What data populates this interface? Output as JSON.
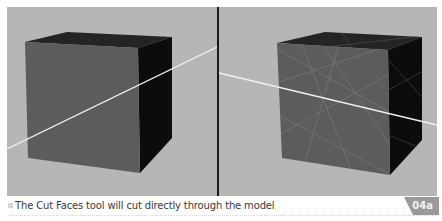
{
  "figure": {
    "caption": "The Cut Faces tool will cut directly through the model",
    "badge": "04a",
    "colors": {
      "viewport_bg": "#b6b6b6",
      "cube_front": "#5c5c5c",
      "cube_top": "#222222",
      "cube_side": "#0c0c0c",
      "cut_line": "#f4f4f4",
      "divider": "#1a1a1a",
      "badge_bg": "#9a9a9a",
      "caption_text": "#3a3a3a"
    }
  },
  "panels": [
    {
      "name": "before-cut",
      "description": "Cube with cut line drawn across the viewport"
    },
    {
      "name": "after-cut",
      "description": "Cube with cut line and resulting face edges"
    }
  ]
}
